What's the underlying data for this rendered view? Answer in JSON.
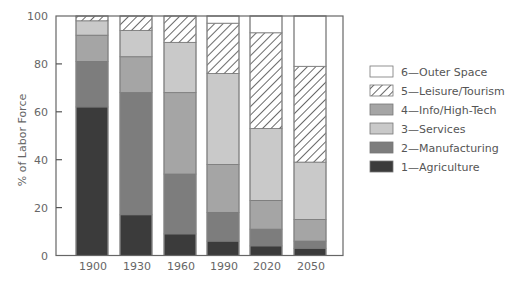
{
  "chart_data": {
    "type": "bar",
    "stacked": true,
    "title": "",
    "xlabel": "",
    "ylabel": "% of Labor Force",
    "ylim": [
      0,
      100
    ],
    "yticks": [
      0,
      20,
      40,
      60,
      80,
      100
    ],
    "grid": false,
    "legend_position": "right",
    "categories": [
      "1900",
      "1930",
      "1960",
      "1990",
      "2020",
      "2050"
    ],
    "series": [
      {
        "name": "1—Agriculture",
        "color": "#3b3b3b",
        "pattern": "solid",
        "values": [
          62,
          17,
          9,
          6,
          4,
          3
        ]
      },
      {
        "name": "2—Manufacturing",
        "color": "#7d7d7d",
        "pattern": "solid",
        "values": [
          19,
          51,
          25,
          12,
          7,
          3
        ]
      },
      {
        "name": "3—Services",
        "color": "#c9c9c9",
        "pattern": "solid",
        "values": [
          6,
          11,
          21,
          38,
          30,
          24
        ]
      },
      {
        "name": "4—Info/High-Tech",
        "color": "#a5a5a5",
        "pattern": "solid",
        "values": [
          11,
          15,
          34,
          20,
          12,
          9
        ]
      },
      {
        "name": "5—Leisure/Tourism",
        "color": "#ffffff",
        "pattern": "hatch",
        "values": [
          2,
          6,
          11,
          21,
          40,
          40
        ]
      },
      {
        "name": "6—Outer Space",
        "color": "#ffffff",
        "pattern": "solid",
        "values": [
          0,
          0,
          0,
          3,
          7,
          21
        ]
      }
    ],
    "stack_order": [
      "1—Agriculture",
      "2—Manufacturing",
      "4—Info/High-Tech",
      "3—Services",
      "5—Leisure/Tourism",
      "6—Outer Space"
    ],
    "legend_order": [
      "6—Outer Space",
      "5—Leisure/Tourism",
      "4—Info/High-Tech",
      "3—Services",
      "2—Manufacturing",
      "1—Agriculture"
    ]
  }
}
